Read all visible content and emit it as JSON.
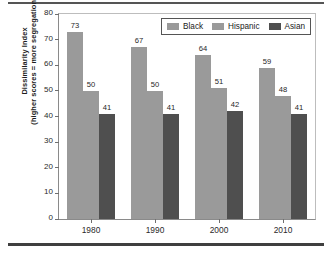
{
  "chart_data": {
    "type": "bar",
    "title": "",
    "subtitle": "",
    "xlabel": "",
    "ylabel_line1": "Dissimilarity Index",
    "ylabel_line2": "(higher scores = more segregation)",
    "categories": [
      "1980",
      "1990",
      "2000",
      "2010"
    ],
    "series": [
      {
        "name": "Black",
        "color": "#9a9a9a",
        "values": [
          73,
          67,
          64,
          59
        ]
      },
      {
        "name": "Hispanic",
        "color": "#9a9a9a",
        "values": [
          50,
          50,
          51,
          48
        ]
      },
      {
        "name": "Asian",
        "color": "#4f4f4f",
        "values": [
          41,
          41,
          42,
          41
        ]
      }
    ],
    "ylim": [
      0,
      80
    ],
    "ytick_values": [
      0,
      10,
      20,
      30,
      40,
      50,
      60,
      70,
      80
    ],
    "ytick_labels": [
      "0",
      "10",
      "20",
      "30",
      "40",
      "50",
      "60",
      "70",
      "80"
    ],
    "grid": false,
    "legend_position": "upper right",
    "bar_value_labels": true
  },
  "figure": {
    "rule_color": "#3f3f3f",
    "axis_color": "#8a8a8a"
  }
}
